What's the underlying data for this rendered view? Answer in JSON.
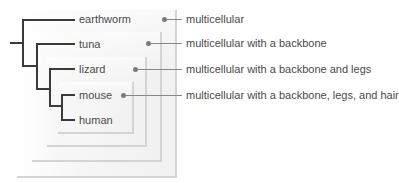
{
  "diagram": {
    "type": "cladogram",
    "taxa": [
      "earthworm",
      "tuna",
      "lizard",
      "mouse",
      "human"
    ],
    "traits": [
      "multicellular",
      "multicellular with a backbone",
      "multicellular with a backbone and legs",
      "multicellular with a backbone, legs, and hair"
    ],
    "colors": {
      "branch": "#3a3a3a",
      "text": "#4a4a4a",
      "box_edge": "#d4d4d4",
      "dot": "#7a7a7a"
    }
  }
}
